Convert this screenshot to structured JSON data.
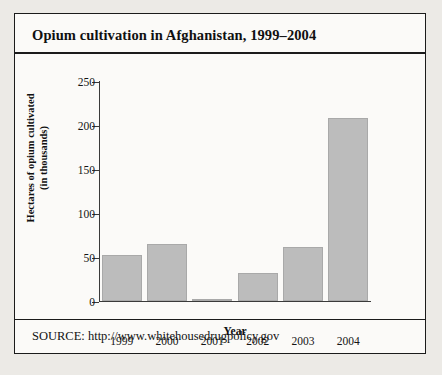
{
  "figure": {
    "title": "Opium cultivation in Afghanistan, 1999–2004",
    "source": "SOURCE: http://www.whitehousedrugpolicy.gov"
  },
  "chart_data": {
    "type": "bar",
    "title": "Opium cultivation in Afghanistan, 1999–2004",
    "categories": [
      "1999",
      "2000",
      "2001",
      "2002",
      "2003",
      "2004"
    ],
    "values": [
      52,
      64,
      1,
      31,
      61,
      208
    ],
    "xlabel": "Year",
    "ylabel": "Hectares of opium cultivated (in thousands)",
    "ylabel_lines": [
      "Hectares of opium cultivated",
      "(in thousands)"
    ],
    "ylim": [
      0,
      250
    ],
    "yticks": [
      0,
      50,
      100,
      150,
      200,
      250
    ],
    "ytick_labels": [
      "0",
      "50",
      "100",
      "150",
      "200",
      "250"
    ],
    "grid": false,
    "legend": false,
    "bar_color": "#bcbcbc",
    "axis_color": "#3a3a3a"
  }
}
